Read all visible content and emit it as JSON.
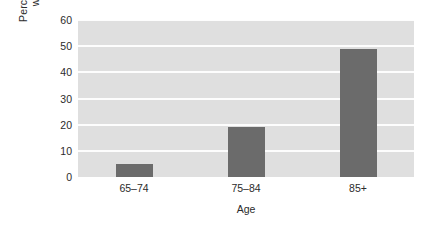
{
  "chart_data": {
    "type": "bar",
    "title": "",
    "subtitle": "",
    "categories": [
      "65–74",
      "75–84",
      "85+"
    ],
    "values": [
      5,
      19,
      49
    ],
    "series": [
      {
        "name": "Percentage of persons with Alzheimer's",
        "values": [
          5,
          19,
          49
        ]
      }
    ],
    "xlabel": "Age",
    "ylabel": "Percentage of persons with Alzheimer's",
    "ylabel_lines": [
      "Percentage of  persons",
      "with Alzheimer's"
    ],
    "ylim": [
      0,
      60
    ],
    "yticks": [
      0,
      10,
      20,
      30,
      40,
      50,
      60
    ],
    "ytick_labels": [
      "0",
      "10",
      "20",
      "30",
      "40",
      "50",
      "60"
    ],
    "grid": "horizontal",
    "legend": "none",
    "annotations": [],
    "colors": {
      "bar": "#6b6b6b",
      "plot_background": "#dfdfdf",
      "gridline": "#fdfdfd",
      "figure_background": "#ffffff",
      "text": "#2b2b2b"
    }
  }
}
